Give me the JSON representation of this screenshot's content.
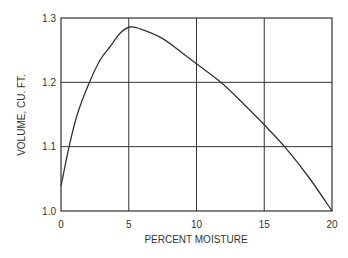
{
  "chart_data": {
    "type": "line",
    "title": "",
    "xlabel": "PERCENT MOISTURE",
    "ylabel": "VOLUME, CU. FT.",
    "xlim": [
      0,
      20
    ],
    "ylim": [
      1.0,
      1.3
    ],
    "x_ticks": [
      "0",
      "5",
      "10",
      "15",
      "20"
    ],
    "y_ticks": [
      "1.0",
      "1.1",
      "1.2",
      "1.3"
    ],
    "grid": true,
    "legend": null,
    "series": [
      {
        "name": "Volume",
        "x": [
          0,
          0.6,
          1.2,
          2.1,
          2.9,
          3.6,
          4.4,
          5.1,
          6.0,
          7.5,
          9.0,
          10.0,
          11.8,
          13.5,
          15.0,
          16.5,
          18.3,
          20.0
        ],
        "y": [
          1.039,
          1.1,
          1.15,
          1.2,
          1.235,
          1.255,
          1.277,
          1.286,
          1.282,
          1.268,
          1.245,
          1.229,
          1.2,
          1.166,
          1.134,
          1.1,
          1.052,
          1.0
        ]
      }
    ]
  }
}
